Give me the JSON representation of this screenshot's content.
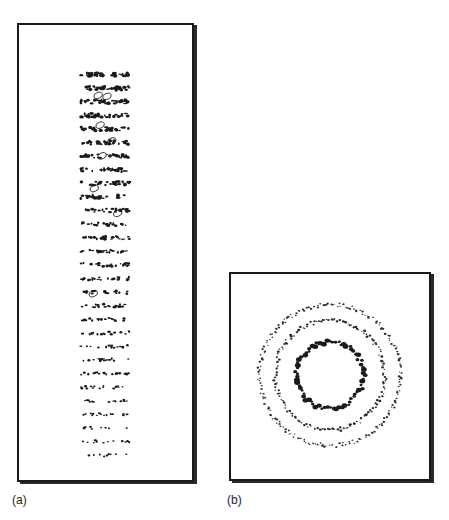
{
  "figure": {
    "panels": [
      {
        "id": "a",
        "label": "(a)",
        "description": "Rectangular plate with stacked horizontal bands of dark flecks, denser at top and sparser toward bottom",
        "band_count": 29,
        "band_x_range": [
          82,
          132
        ],
        "band_y_first": 75,
        "band_y_last": 459,
        "density_top": 1.0,
        "density_bottom": 0.35,
        "outlined_blobs": [
          {
            "x": 100,
            "y": 96
          },
          {
            "x": 109,
            "y": 97
          },
          {
            "x": 102,
            "y": 126
          },
          {
            "x": 114,
            "y": 142
          },
          {
            "x": 104,
            "y": 157
          },
          {
            "x": 96,
            "y": 190
          },
          {
            "x": 120,
            "y": 215
          },
          {
            "x": 95,
            "y": 296
          }
        ]
      },
      {
        "id": "b",
        "label": "(b)",
        "description": "Square plate with three concentric dotted rings",
        "center": [
          332,
          377
        ],
        "rings": [
          {
            "name": "inner",
            "radius": 34,
            "dot_size": 2.4,
            "dot_count": 70,
            "color": "#1a1a1a"
          },
          {
            "name": "middle",
            "radius": 56,
            "dot_size": 1.2,
            "dot_count": 160,
            "color": "#2a2a2a"
          },
          {
            "name": "outer",
            "radius": 72,
            "dot_size": 1.1,
            "dot_count": 210,
            "color": "#333333"
          }
        ]
      }
    ]
  },
  "colors": {
    "ink": "#1a1a1a",
    "paper": "#ffffff",
    "frame": "#1a1a1a"
  }
}
